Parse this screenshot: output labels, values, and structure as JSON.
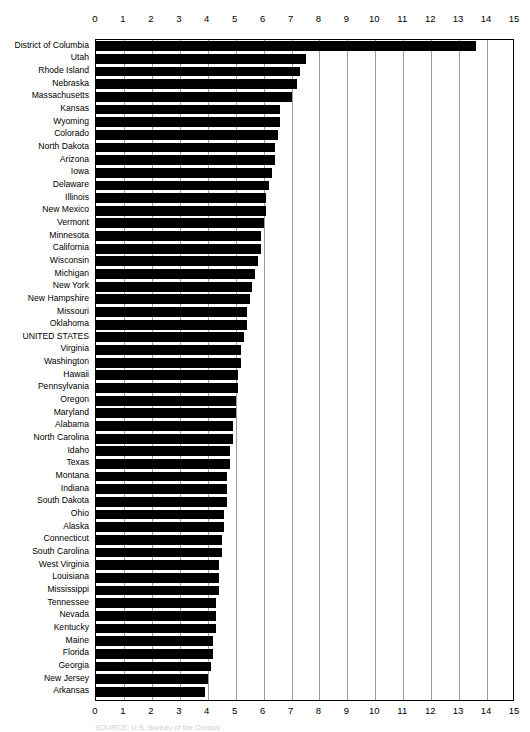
{
  "chart_data": {
    "type": "bar",
    "orientation": "horizontal",
    "title": "",
    "xlabel": "",
    "ylabel": "",
    "xlim": [
      0,
      15
    ],
    "xticks": [
      0,
      1,
      2,
      3,
      4,
      5,
      6,
      7,
      8,
      9,
      10,
      11,
      12,
      13,
      14,
      15
    ],
    "xtick_labels": [
      "0",
      "1",
      "2",
      "3",
      "4",
      "5",
      "6",
      "7",
      "8",
      "9",
      "10",
      "11",
      "12",
      "13",
      "14",
      "15"
    ],
    "grid": true,
    "legend": null,
    "bar_color": "#000000",
    "categories": [
      "District of Columbia",
      "Utah",
      "Rhode Island",
      "Nebraska",
      "Massachusetts",
      "Kansas",
      "Wyoming",
      "Colorado",
      "North Dakota",
      "Arizona",
      "Iowa",
      "Delaware",
      "Illinois",
      "New Mexico",
      "Vermont",
      "Minnesota",
      "California",
      "Wisconsin",
      "Michigan",
      "New York",
      "New Hampshire",
      "Missouri",
      "Oklahoma",
      "UNITED STATES",
      "Virginia",
      "Washington",
      "Hawaii",
      "Pennsylvania",
      "Oregon",
      "Maryland",
      "Alabama",
      "North Carolina",
      "Idaho",
      "Texas",
      "Montana",
      "Indiana",
      "South Dakota",
      "Ohio",
      "Alaska",
      "Connecticut",
      "South Carolina",
      "West Virginia",
      "Louisiana",
      "Mississippi",
      "Tennessee",
      "Nevada",
      "Kentucky",
      "Maine",
      "Florida",
      "Georgia",
      "New Jersey",
      "Arkansas"
    ],
    "values": [
      13.6,
      7.5,
      7.3,
      7.2,
      7.0,
      6.6,
      6.6,
      6.5,
      6.4,
      6.4,
      6.3,
      6.2,
      6.1,
      6.1,
      6.0,
      5.9,
      5.9,
      5.8,
      5.7,
      5.6,
      5.5,
      5.4,
      5.4,
      5.3,
      5.2,
      5.2,
      5.1,
      5.1,
      5.0,
      5.0,
      4.9,
      4.9,
      4.8,
      4.8,
      4.7,
      4.7,
      4.7,
      4.6,
      4.6,
      4.5,
      4.5,
      4.4,
      4.4,
      4.4,
      4.3,
      4.3,
      4.3,
      4.2,
      4.2,
      4.1,
      4.0,
      3.9
    ]
  },
  "source": {
    "text": "SOURCE: U.S. Bureau of the Census"
  }
}
